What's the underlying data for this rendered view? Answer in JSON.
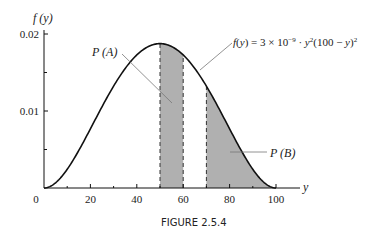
{
  "chart_data": {
    "type": "area",
    "title": "",
    "caption": "FIGURE 2.5.4",
    "xlabel": "y",
    "ylabel": "f (y)",
    "xlim": [
      0,
      100
    ],
    "ylim": [
      0,
      0.02
    ],
    "x_ticks": [
      0,
      20,
      40,
      60,
      80,
      100
    ],
    "x_tick_labels": [
      "0",
      "20",
      "40",
      "60",
      "80",
      "100"
    ],
    "x_minor_ticks": [
      10,
      30,
      50,
      70,
      90
    ],
    "y_ticks": [
      0.01,
      0.02
    ],
    "y_tick_labels": [
      "0.01",
      "0.02"
    ],
    "y_minor_ticks": [
      0.005,
      0.015
    ],
    "grid": false,
    "function": {
      "label": "f(y) = 3 × 10⁻⁹ · y²(100 − y)²",
      "coefficient": 3e-09,
      "domain": [
        0,
        100
      ]
    },
    "shaded_regions": [
      {
        "name": "P (A)",
        "from": 50,
        "to": 60,
        "color": "#b0b0b0"
      },
      {
        "name": "P (B)",
        "from": 70,
        "to": 100,
        "color": "#b0b0b0"
      }
    ],
    "annotations": [
      {
        "text": "P (A)",
        "points_to": "region A"
      },
      {
        "text": "P (B)",
        "points_to": "region B"
      },
      {
        "text": "f(y) = 3 × 10⁻⁹ · y²(100 − y)²",
        "points_to": "curve"
      }
    ]
  }
}
